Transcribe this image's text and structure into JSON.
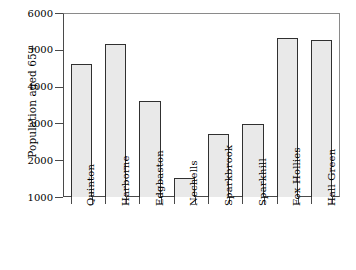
{
  "chart_data": {
    "type": "bar",
    "title": "",
    "subtitle": "",
    "xlabel": "",
    "ylabel": "Population aged 65+",
    "categories": [
      "Quinton",
      "Harborne",
      "Edgbaston",
      "Nechells",
      "Sparkbrook",
      "Sparkhill",
      "Fox Hollies",
      "Hall Green"
    ],
    "values": [
      4620,
      5150,
      3620,
      1520,
      2700,
      2990,
      5320,
      5270
    ],
    "ylim": [
      1000,
      6000
    ],
    "yticks": [
      1000,
      2000,
      3000,
      4000,
      5000,
      6000
    ],
    "ytick_labels": [
      "1000",
      "2000",
      "3000",
      "4000",
      "5000",
      "6000"
    ],
    "grid": false,
    "legend": null,
    "bar_fill_color": "#e9e9e9",
    "bar_edge_color": "#303030",
    "axis_color": "#4a4a4a",
    "background_color": "#ffffff"
  }
}
